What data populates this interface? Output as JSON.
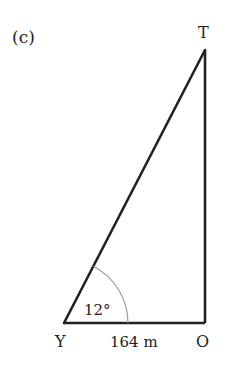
{
  "part_label": "(c)",
  "vertices": {
    "top": "T",
    "bottom_left": "Y",
    "bottom_right": "O"
  },
  "angle_label": "12°",
  "base_label": "164 m",
  "colors": {
    "line": "#222222",
    "arc": "#9a9a9a",
    "text": "#222222",
    "background": "#ffffff"
  }
}
